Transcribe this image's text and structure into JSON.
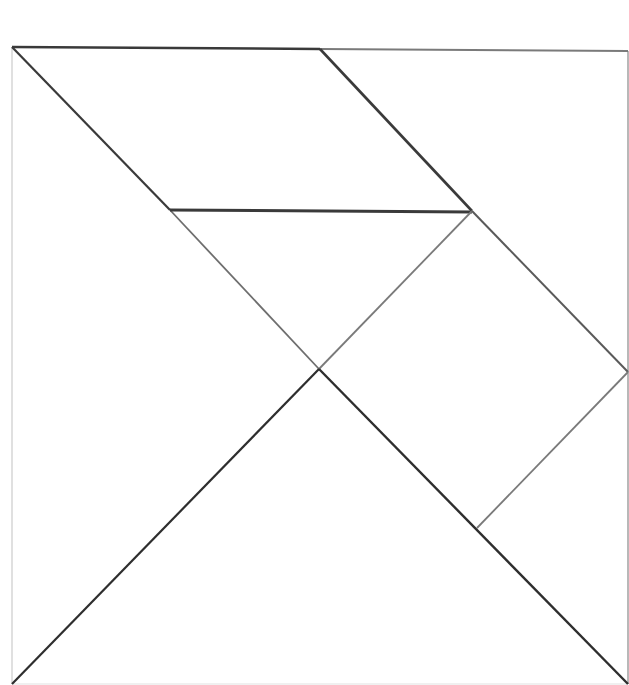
{
  "diagram": {
    "type": "tangram",
    "background": "#ffffff",
    "line_colors": {
      "dark": "#3a3a3a",
      "medium": "#6e6e6e",
      "light": "#a8a8a8",
      "faint": "#dcdcdc"
    },
    "pieces": [
      {
        "id": "large-triangle-left",
        "points": "12,47 319,369 12,684"
      },
      {
        "id": "large-triangle-bottom",
        "points": "12,684 319,369 628,684"
      },
      {
        "id": "parallelogram-top",
        "points": "12,47 320,49 472,211 170,210"
      },
      {
        "id": "medium-triangle-top-right",
        "points": "320,49 628,51 628,372 472,211"
      },
      {
        "id": "small-triangle-center",
        "points": "170,210 472,211 319,369"
      },
      {
        "id": "square-right",
        "points": "472,211 628,372 477,528 319,369"
      },
      {
        "id": "small-triangle-bottom-right",
        "points": "628,372 628,684 477,528"
      }
    ]
  }
}
